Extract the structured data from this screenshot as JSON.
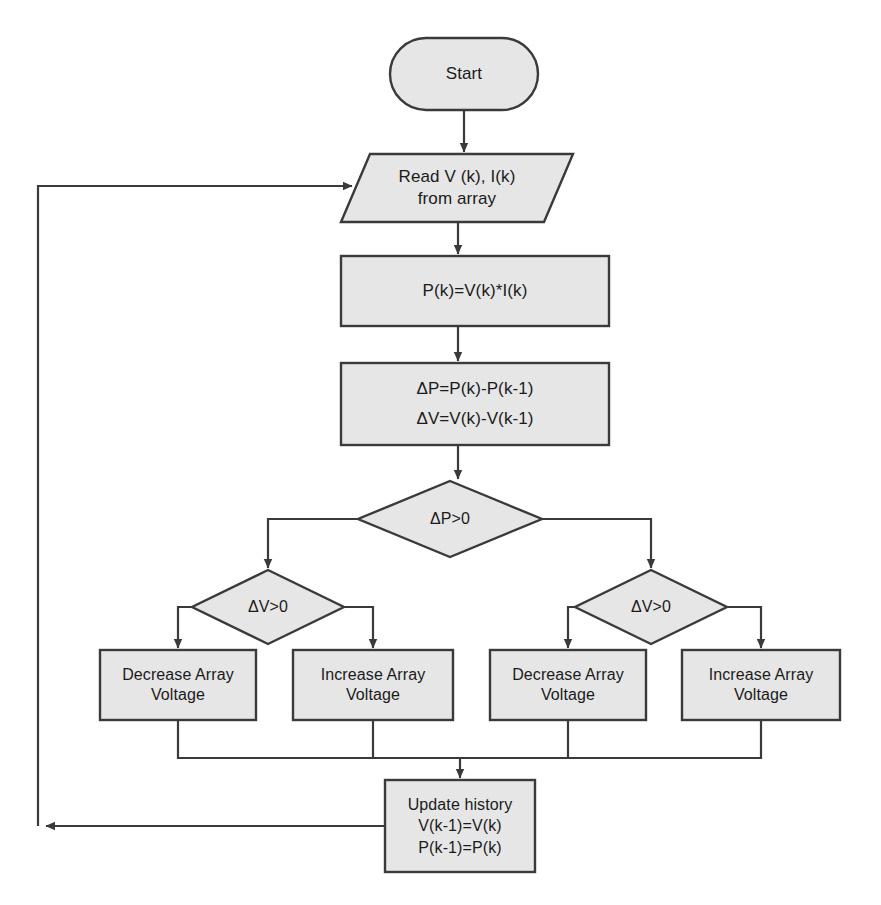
{
  "diagram": {
    "style": {
      "node_fill": "#e6e6e6",
      "node_stroke": "#3a3a3a",
      "connector_stroke": "#3a3a3a",
      "text_color": "#1b1b1b",
      "background": "#ffffff"
    },
    "nodes": [
      {
        "id": "start",
        "shape": "terminator",
        "label": "Start",
        "x": 390,
        "y": 38,
        "w": 148,
        "h": 72
      },
      {
        "id": "read",
        "shape": "parallelogram",
        "label": "Read V (k), I(k)\nfrom array",
        "x": 341,
        "y": 154,
        "w": 232,
        "h": 68
      },
      {
        "id": "power",
        "shape": "process",
        "label": "P(k)=V(k)*I(k)",
        "x": 341,
        "y": 256,
        "w": 268,
        "h": 70
      },
      {
        "id": "deltas",
        "shape": "process",
        "label": "ΔP=P(k)-P(k-1)\nΔV=V(k)-V(k-1)",
        "x": 341,
        "y": 363,
        "w": 268,
        "h": 82
      },
      {
        "id": "dp-decision",
        "shape": "decision",
        "label": "ΔP>0",
        "x": 358,
        "y": 481,
        "w": 184,
        "h": 76
      },
      {
        "id": "dv-left-decision",
        "shape": "decision",
        "label": "ΔV>0",
        "x": 192,
        "y": 570,
        "w": 152,
        "h": 74
      },
      {
        "id": "dv-right-decision",
        "shape": "decision",
        "label": "ΔV>0",
        "x": 575,
        "y": 570,
        "w": 152,
        "h": 74
      },
      {
        "id": "decrease-left",
        "shape": "process",
        "label": "Decrease Array\nVoltage",
        "x": 100,
        "y": 650,
        "w": 156,
        "h": 70
      },
      {
        "id": "increase-left",
        "shape": "process",
        "label": "Increase Array\nVoltage",
        "x": 293,
        "y": 650,
        "w": 160,
        "h": 70
      },
      {
        "id": "decrease-right",
        "shape": "process",
        "label": "Decrease Array\nVoltage",
        "x": 490,
        "y": 650,
        "w": 156,
        "h": 70
      },
      {
        "id": "increase-right",
        "shape": "process",
        "label": "Increase Array\nVoltage",
        "x": 682,
        "y": 650,
        "w": 158,
        "h": 70
      },
      {
        "id": "update-history",
        "shape": "process",
        "label": "Update history\nV(k-1)=V(k)\nP(k-1)=P(k)",
        "x": 385,
        "y": 780,
        "w": 150,
        "h": 92
      }
    ],
    "connectors": [
      {
        "id": "start-to-read",
        "from": "start",
        "to": "read"
      },
      {
        "id": "read-to-power",
        "from": "read",
        "to": "power"
      },
      {
        "id": "power-to-deltas",
        "from": "power",
        "to": "deltas"
      },
      {
        "id": "deltas-to-dp",
        "from": "deltas",
        "to": "dp-decision"
      },
      {
        "id": "dp-to-dv-left",
        "from": "dp-decision",
        "to": "dv-left-decision"
      },
      {
        "id": "dp-to-dv-right",
        "from": "dp-decision",
        "to": "dv-right-decision"
      },
      {
        "id": "dv-left-to-decrease",
        "from": "dv-left-decision",
        "to": "decrease-left"
      },
      {
        "id": "dv-left-to-increase",
        "from": "dv-left-decision",
        "to": "increase-left"
      },
      {
        "id": "dv-right-to-decrease",
        "from": "dv-right-decision",
        "to": "decrease-right"
      },
      {
        "id": "dv-right-to-increase",
        "from": "dv-right-decision",
        "to": "increase-right"
      },
      {
        "id": "merge-to-update",
        "from": "action-row",
        "to": "update-history"
      },
      {
        "id": "update-to-read-feedback",
        "from": "update-history",
        "to": "read"
      }
    ]
  }
}
